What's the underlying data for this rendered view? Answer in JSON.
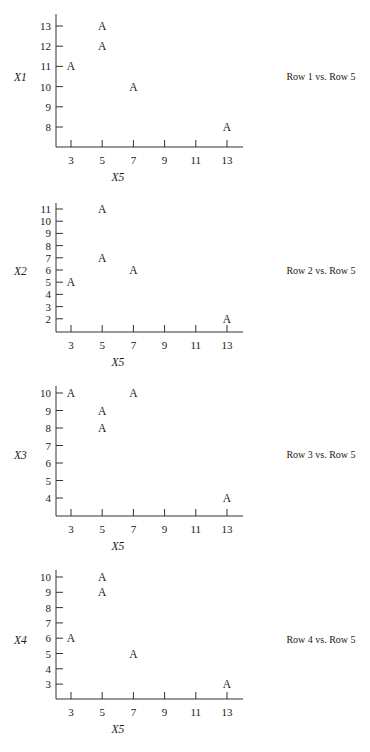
{
  "chart_data": [
    {
      "type": "scatter",
      "title": "Row 1 vs. Row 5",
      "xlabel": "X5",
      "ylabel": "X1",
      "marker": "A",
      "x_ticks": [
        3,
        5,
        7,
        9,
        11,
        13
      ],
      "y_ticks": [
        8,
        9,
        10,
        11,
        12,
        13
      ],
      "points": [
        {
          "x": 3,
          "y": 11
        },
        {
          "x": 5,
          "y": 13
        },
        {
          "x": 5,
          "y": 12
        },
        {
          "x": 7,
          "y": 10
        },
        {
          "x": 13,
          "y": 8
        }
      ],
      "layout": {
        "top": 14,
        "axis_y": 147,
        "y_top_value": 13,
        "y_top_px": 26,
        "y_px_per_unit": 20.2,
        "caption_y": 77
      }
    },
    {
      "type": "scatter",
      "title": "Row 2 vs. Row 5",
      "xlabel": "X5",
      "ylabel": "X2",
      "marker": "A",
      "x_ticks": [
        3,
        5,
        7,
        9,
        11,
        13
      ],
      "y_ticks": [
        2,
        3,
        4,
        5,
        6,
        7,
        8,
        9,
        10,
        11
      ],
      "points": [
        {
          "x": 3,
          "y": 5
        },
        {
          "x": 5,
          "y": 11
        },
        {
          "x": 5,
          "y": 7
        },
        {
          "x": 7,
          "y": 6
        },
        {
          "x": 13,
          "y": 2
        }
      ],
      "layout": {
        "top": 203,
        "axis_y": 332,
        "y_top_value": 11,
        "y_top_px": 209,
        "y_px_per_unit": 12.2,
        "caption_y": 271
      }
    },
    {
      "type": "scatter",
      "title": "Row 3 vs. Row 5",
      "xlabel": "X5",
      "ylabel": "X3",
      "marker": "A",
      "x_ticks": [
        3,
        5,
        7,
        9,
        11,
        13
      ],
      "y_ticks": [
        4,
        5,
        6,
        7,
        8,
        9,
        10
      ],
      "points": [
        {
          "x": 3,
          "y": 10
        },
        {
          "x": 5,
          "y": 9
        },
        {
          "x": 5,
          "y": 8
        },
        {
          "x": 7,
          "y": 10
        },
        {
          "x": 13,
          "y": 4
        }
      ],
      "layout": {
        "top": 386,
        "axis_y": 516,
        "y_top_value": 10,
        "y_top_px": 393,
        "y_px_per_unit": 17.5,
        "caption_y": 455
      }
    },
    {
      "type": "scatter",
      "title": "Row 4 vs. Row 5",
      "xlabel": "X5",
      "ylabel": "X4",
      "marker": "A",
      "x_ticks": [
        3,
        5,
        7,
        9,
        11,
        13
      ],
      "y_ticks": [
        3,
        4,
        5,
        6,
        7,
        8,
        9,
        10
      ],
      "points": [
        {
          "x": 3,
          "y": 6
        },
        {
          "x": 5,
          "y": 10
        },
        {
          "x": 5,
          "y": 9
        },
        {
          "x": 7,
          "y": 5
        },
        {
          "x": 13,
          "y": 3
        }
      ],
      "layout": {
        "top": 570,
        "axis_y": 699,
        "y_top_value": 10,
        "y_top_px": 577,
        "y_px_per_unit": 15.3,
        "caption_y": 640
      }
    }
  ],
  "x_axis_geometry": {
    "axis_x": 56,
    "x_right": 243,
    "x3_px": 71,
    "px_per_unit": 15.6,
    "tick_len": 7
  }
}
